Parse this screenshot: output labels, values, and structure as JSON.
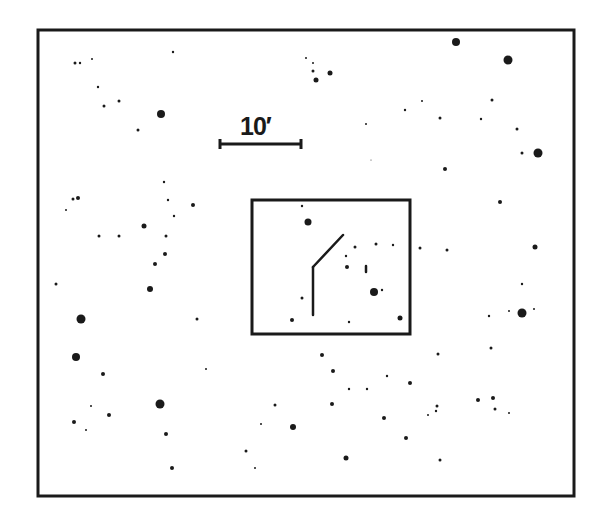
{
  "chart": {
    "scale_bar": {
      "label": "10′",
      "x1": 220,
      "x2": 301,
      "y": 144
    },
    "outer_frame": {
      "x": 37,
      "y": 29,
      "w": 237,
      "h": 0
    },
    "colors": {
      "ink": "#1a1a1a",
      "background": "#ffffff"
    }
  },
  "chart_data": {
    "type": "scatter",
    "title": "",
    "xlabel": "",
    "ylabel": "",
    "annotations": [
      "10′ scale bar",
      "inset box around target",
      "target marker lines"
    ],
    "stars": [
      [
        75,
        63,
        1.5
      ],
      [
        80,
        63,
        1.2
      ],
      [
        92,
        59,
        1
      ],
      [
        173,
        52,
        1.2
      ],
      [
        98,
        87,
        1.2
      ],
      [
        104,
        106,
        1.5
      ],
      [
        119,
        101,
        1.5
      ],
      [
        138,
        130,
        1.5
      ],
      [
        161,
        114,
        4
      ],
      [
        306,
        58,
        1
      ],
      [
        313,
        63,
        1
      ],
      [
        313,
        71,
        1.5
      ],
      [
        316,
        80,
        2.5
      ],
      [
        330,
        73,
        2.5
      ],
      [
        456,
        42,
        4
      ],
      [
        508,
        60,
        4.5
      ],
      [
        405,
        110,
        1.2
      ],
      [
        422,
        101,
        1
      ],
      [
        440,
        118,
        1.5
      ],
      [
        481,
        119,
        1.2
      ],
      [
        492,
        100,
        1.5
      ],
      [
        517,
        129,
        1.5
      ],
      [
        522,
        153,
        1.5
      ],
      [
        538,
        153,
        4.5
      ],
      [
        445,
        169,
        2
      ],
      [
        366,
        124,
        1
      ],
      [
        371,
        160,
        0.5
      ],
      [
        73,
        199,
        1.5
      ],
      [
        78,
        198,
        2
      ],
      [
        66,
        210,
        1
      ],
      [
        164,
        182,
        1.2
      ],
      [
        168,
        200,
        1.2
      ],
      [
        193,
        205,
        2
      ],
      [
        174,
        216,
        1.2
      ],
      [
        144,
        226,
        2.5
      ],
      [
        99,
        236,
        1.5
      ],
      [
        119,
        236,
        1.5
      ],
      [
        166,
        236,
        1.5
      ],
      [
        165,
        254,
        2
      ],
      [
        155,
        264,
        2
      ],
      [
        500,
        202,
        2
      ],
      [
        535,
        247,
        2.5
      ],
      [
        420,
        248,
        1.5
      ],
      [
        447,
        250,
        1.5
      ],
      [
        56,
        284,
        1.5
      ],
      [
        150,
        289,
        3
      ],
      [
        81,
        319,
        4.5
      ],
      [
        197,
        319,
        1.5
      ],
      [
        76,
        357,
        4
      ],
      [
        103,
        374,
        2
      ],
      [
        206,
        369,
        1
      ],
      [
        91,
        406,
        1
      ],
      [
        160,
        404,
        4.5
      ],
      [
        109,
        415,
        2
      ],
      [
        74,
        422,
        2
      ],
      [
        86,
        430,
        1
      ],
      [
        166,
        434,
        2
      ],
      [
        172,
        468,
        2
      ],
      [
        275,
        405,
        1.5
      ],
      [
        261,
        424,
        1
      ],
      [
        246,
        451,
        1.5
      ],
      [
        255,
        468,
        1
      ],
      [
        293,
        427,
        3
      ],
      [
        522,
        284,
        1.2
      ],
      [
        489,
        316,
        1.2
      ],
      [
        509,
        311,
        1
      ],
      [
        522,
        313,
        4.5
      ],
      [
        534,
        309,
        1
      ],
      [
        491,
        348,
        1.5
      ],
      [
        438,
        354,
        1.5
      ],
      [
        322,
        355,
        2
      ],
      [
        333,
        371,
        2
      ],
      [
        387,
        376,
        1.2
      ],
      [
        410,
        383,
        2
      ],
      [
        349,
        389,
        1.2
      ],
      [
        367,
        389,
        1.2
      ],
      [
        332,
        404,
        2
      ],
      [
        437,
        406,
        1.5
      ],
      [
        436,
        411,
        1.2
      ],
      [
        428,
        415,
        1
      ],
      [
        478,
        400,
        2
      ],
      [
        493,
        398,
        2
      ],
      [
        495,
        409,
        1.5
      ],
      [
        509,
        413,
        1
      ],
      [
        384,
        418,
        2
      ],
      [
        406,
        438,
        2
      ],
      [
        346,
        458,
        2.5
      ],
      [
        440,
        460,
        1.5
      ]
    ],
    "inset": {
      "box": {
        "x": 252,
        "y": 200,
        "w": 158,
        "h": 134
      },
      "stars": [
        [
          302,
          206,
          1.2
        ],
        [
          308,
          222,
          3.5
        ],
        [
          355,
          247,
          1.5
        ],
        [
          346,
          256,
          1.2
        ],
        [
          376,
          244,
          1.5
        ],
        [
          393,
          245,
          1.2
        ],
        [
          347,
          267,
          2
        ],
        [
          374,
          292,
          4
        ],
        [
          382,
          290,
          1.2
        ],
        [
          302,
          298,
          1.5
        ],
        [
          292,
          320,
          2
        ],
        [
          349,
          322,
          1.2
        ],
        [
          400,
          318,
          2.5
        ]
      ],
      "marker": {
        "segments": [
          [
            313,
            267,
            343,
            235
          ],
          [
            313,
            267,
            313,
            315
          ]
        ],
        "tick": [
          366,
          269
        ]
      }
    }
  }
}
